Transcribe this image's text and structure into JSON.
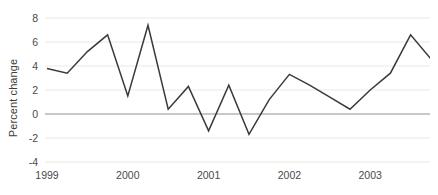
{
  "chart_data": {
    "type": "line",
    "title": "",
    "subtitle": "",
    "xlabel": "",
    "ylabel": "Percent change",
    "x_tick_labels": [
      "1999",
      "2000",
      "2001",
      "2002",
      "2003"
    ],
    "y_tick_labels": [
      "8",
      "6",
      "4",
      "2",
      "0",
      "-2",
      "-4"
    ],
    "y_ticks": [
      8,
      6,
      4,
      2,
      0,
      -2,
      -4
    ],
    "ylim": [
      -4,
      8
    ],
    "xlim": [
      "1999 Q1",
      "2003 Q4"
    ],
    "grid": "horizontal",
    "legend": "none",
    "zero_line": true,
    "series": [
      {
        "name": "Percent change",
        "color": "#3a3a38",
        "x": [
          "1999 Q1",
          "1999 Q2",
          "1999 Q3",
          "1999 Q4",
          "2000 Q1",
          "2000 Q2",
          "2000 Q3",
          "2000 Q4",
          "2001 Q1",
          "2001 Q2",
          "2001 Q3",
          "2001 Q4",
          "2002 Q1",
          "2002 Q2",
          "2002 Q3",
          "2002 Q4",
          "2003 Q1",
          "2003 Q2",
          "2003 Q3",
          "2003 Q4"
        ],
        "values": [
          3.8,
          3.4,
          5.2,
          6.6,
          1.5,
          7.4,
          0.4,
          2.3,
          -1.4,
          2.4,
          -1.7,
          1.2,
          3.3,
          2.4,
          1.4,
          0.4,
          2.0,
          3.4,
          6.6,
          4.6
        ]
      }
    ]
  },
  "style": {
    "line_color": "#3a3a38",
    "grid_color": "#e9e9e6",
    "zero_line_color": "#9a9a96",
    "text_color": "#4a4a4a",
    "background": "#ffffff"
  }
}
